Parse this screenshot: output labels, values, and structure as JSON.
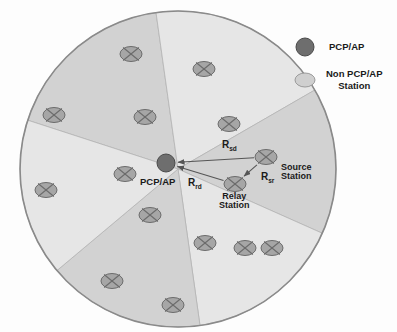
{
  "figure": {
    "canvas": {
      "width": 397,
      "height": 332
    },
    "background": "#fdfdfd"
  },
  "colors": {
    "pcp_ap": "#6e6e6e",
    "pcp_ap_stroke": "#4a4a4a",
    "station_fill": "#a6a6a6",
    "station_stroke": "#6b6b6b",
    "sector_light": "#e6e6e6",
    "sector_dark": "#d2d2d2",
    "cell_outline": "#8a8a8a",
    "arrow": "#555555",
    "text": "#1a1a1a"
  },
  "cell": {
    "name": "coverage-cell",
    "center": {
      "x": 178,
      "y": 169
    },
    "radius": 158,
    "sector_count": 6,
    "sectors": [
      {
        "id": "sector-1",
        "start_deg": 198,
        "end_deg": 262,
        "shade": "dark"
      },
      {
        "id": "sector-2",
        "start_deg": 262,
        "end_deg": 330,
        "shade": "light"
      },
      {
        "id": "sector-3",
        "start_deg": 330,
        "end_deg": 24,
        "shade": "dark"
      },
      {
        "id": "sector-4",
        "start_deg": 24,
        "end_deg": 82,
        "shade": "light"
      },
      {
        "id": "sector-5",
        "start_deg": 82,
        "end_deg": 140,
        "shade": "dark"
      },
      {
        "id": "sector-6",
        "start_deg": 140,
        "end_deg": 198,
        "shade": "light"
      }
    ]
  },
  "access_point": {
    "name": "pcp-ap-node",
    "label": "PCP/AP",
    "x": 166,
    "y": 163,
    "r": 9,
    "label_x": 140,
    "label_y": 177
  },
  "stations": [
    {
      "id": "sta-1",
      "x": 131,
      "y": 54,
      "role": "generic"
    },
    {
      "id": "sta-2",
      "x": 204,
      "y": 69,
      "role": "generic"
    },
    {
      "id": "sta-3",
      "x": 54,
      "y": 115,
      "role": "generic"
    },
    {
      "id": "sta-4",
      "x": 145,
      "y": 117,
      "role": "generic"
    },
    {
      "id": "sta-5",
      "x": 229,
      "y": 124,
      "role": "generic"
    },
    {
      "id": "sta-6",
      "x": 46,
      "y": 190,
      "role": "generic"
    },
    {
      "id": "sta-7",
      "x": 125,
      "y": 174,
      "role": "generic"
    },
    {
      "id": "sta-8",
      "x": 150,
      "y": 215,
      "role": "generic"
    },
    {
      "id": "sta-9",
      "x": 266,
      "y": 157,
      "role": "source"
    },
    {
      "id": "sta-10",
      "x": 235,
      "y": 184,
      "role": "relay"
    },
    {
      "id": "sta-11",
      "x": 245,
      "y": 248,
      "role": "generic"
    },
    {
      "id": "sta-12",
      "x": 205,
      "y": 243,
      "role": "generic"
    },
    {
      "id": "sta-13",
      "x": 272,
      "y": 248,
      "role": "generic"
    },
    {
      "id": "sta-14",
      "x": 112,
      "y": 281,
      "role": "generic"
    },
    {
      "id": "sta-15",
      "x": 173,
      "y": 305,
      "role": "generic"
    }
  ],
  "station_marker": {
    "name": "station-ellipse-cross-icon",
    "rx": 11,
    "ry": 7.5
  },
  "links": [
    {
      "id": "link-sd",
      "name": "link-source-to-destination",
      "label": "R",
      "subscript": "sd",
      "from": "sta-9",
      "to": "pcp-ap-node",
      "label_x": 222,
      "label_y": 140
    },
    {
      "id": "link-rd",
      "name": "link-relay-to-destination",
      "label": "R",
      "subscript": "rd",
      "from": "sta-10",
      "to": "pcp-ap-node",
      "label_x": 188,
      "label_y": 178
    },
    {
      "id": "link-sr",
      "name": "link-source-to-relay",
      "label": "R",
      "subscript": "sr",
      "from": "sta-9",
      "to": "sta-10",
      "label_x": 261,
      "label_y": 172
    }
  ],
  "node_labels": [
    {
      "id": "source-station-label",
      "name": "source-station-label",
      "line1": "Source",
      "line2": "Station",
      "x": 281,
      "y": 163
    },
    {
      "id": "relay-station-label",
      "name": "relay-station-label",
      "line1": "Relay",
      "line2": "Station",
      "x": 219,
      "y": 192
    }
  ],
  "legend": {
    "name": "legend",
    "items": [
      {
        "id": "legend-pcp-ap",
        "name": "legend-item-pcp-ap",
        "marker": "dark-circle",
        "line1": "PCP/AP",
        "line2": "",
        "marker_x": 305,
        "marker_y": 47,
        "marker_rx": 9,
        "marker_ry": 9,
        "text_x": 329,
        "text_y": 41
      },
      {
        "id": "legend-non-pcp-ap",
        "name": "legend-item-non-pcp-ap-station",
        "marker": "light-ellipse",
        "line1": "Non PCP/AP",
        "line2": "Station",
        "marker_x": 305,
        "marker_y": 80,
        "marker_rx": 10,
        "marker_ry": 7,
        "text_x": 326,
        "text_y": 68
      }
    ]
  }
}
